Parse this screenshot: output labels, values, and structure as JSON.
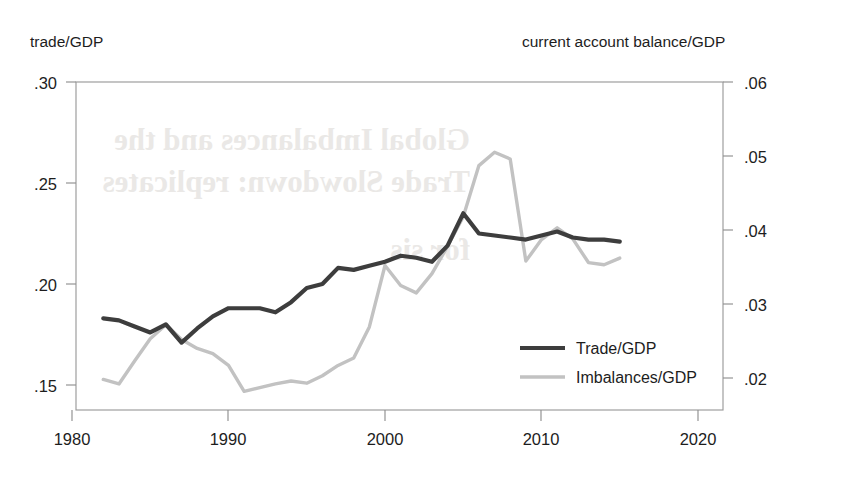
{
  "chart_data": {
    "type": "line",
    "title": "",
    "xlabel": "",
    "ylabel_left": "trade/GDP",
    "ylabel_right": "current account balance/GDP",
    "xlim": [
      1980,
      2020
    ],
    "ylim_left": [
      0.15,
      0.3
    ],
    "ylim_right": [
      0.02,
      0.06
    ],
    "grid": false,
    "legend_position": "center-right",
    "xticks": [
      "1980",
      "1990",
      "2000",
      "2010",
      "2020"
    ],
    "xtick_values": [
      1980,
      1990,
      2000,
      2010,
      2020
    ],
    "yticks_left": [
      ".30",
      ".25",
      ".20",
      ".15"
    ],
    "ytick_left_values": [
      0.3,
      0.25,
      0.2,
      0.15
    ],
    "yticks_right": [
      ".06",
      ".05",
      ".04",
      ".03",
      ".02"
    ],
    "ytick_right_values": [
      0.06,
      0.05,
      0.04,
      0.03,
      0.02
    ],
    "series": [
      {
        "name": "Trade/GDP",
        "axis": "left",
        "color": "#3d3d3d",
        "x": [
          1982,
          1983,
          1984,
          1985,
          1986,
          1987,
          1988,
          1989,
          1990,
          1991,
          1992,
          1993,
          1994,
          1995,
          1996,
          1997,
          1998,
          1999,
          2000,
          2001,
          2002,
          2003,
          2004,
          2005,
          2006,
          2007,
          2008,
          2009,
          2010,
          2011,
          2012,
          2013,
          2014,
          2015
        ],
        "values": [
          0.183,
          0.182,
          0.179,
          0.176,
          0.18,
          0.171,
          0.178,
          0.184,
          0.188,
          0.188,
          0.188,
          0.186,
          0.191,
          0.198,
          0.2,
          0.208,
          0.207,
          0.209,
          0.211,
          0.214,
          0.213,
          0.211,
          0.219,
          0.235,
          0.225,
          0.224,
          0.223,
          0.222,
          0.224,
          0.226,
          0.223,
          0.222,
          0.222,
          0.221
        ]
      },
      {
        "name": "Imbalances/GDP",
        "axis": "right",
        "color": "#c2c2c2",
        "x": [
          1982,
          1983,
          1984,
          1985,
          1986,
          1987,
          1988,
          1989,
          1990,
          1991,
          1992,
          1993,
          1994,
          1995,
          1996,
          1997,
          1998,
          1999,
          2000,
          2001,
          2002,
          2003,
          2004,
          2005,
          2006,
          2007,
          2008,
          2009,
          2010,
          2011,
          2012,
          2013,
          2014,
          2015
        ],
        "values": [
          0.0198,
          0.0192,
          0.0223,
          0.0253,
          0.0272,
          0.0252,
          0.024,
          0.0233,
          0.0217,
          0.0182,
          0.0187,
          0.0192,
          0.0196,
          0.0193,
          0.0203,
          0.0217,
          0.0227,
          0.0269,
          0.0352,
          0.0325,
          0.0315,
          0.0341,
          0.0378,
          0.0418,
          0.0487,
          0.0505,
          0.0496,
          0.0358,
          0.0387,
          0.0403,
          0.0388,
          0.0356,
          0.0353,
          0.0362
        ]
      }
    ]
  },
  "legend": {
    "items": [
      {
        "label": "Trade/GDP",
        "color": "#3d3d3d"
      },
      {
        "label": "Imbalances/GDP",
        "color": "#c2c2c2"
      }
    ]
  },
  "watermark": {
    "line1": "Global Imbalances and the",
    "line2": "Trade Slowdown: replicates",
    "line3": "for sis"
  }
}
